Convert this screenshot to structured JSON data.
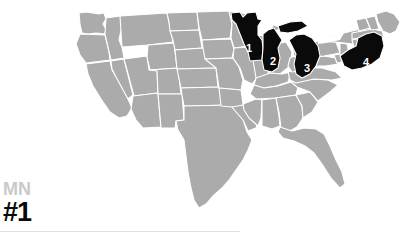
{
  "page": {
    "background_color": "#ffffff",
    "width": 415,
    "height": 237
  },
  "map": {
    "name": "united-states-map",
    "base_state_color": "#ababab",
    "border_color": "#ffffff",
    "highlight_color": "#0a0a0a",
    "label_color": "#ffffff",
    "water_color": "#ffffff",
    "highlighted_states": [
      {
        "rank": "1",
        "code": "MN",
        "name": "Minnesota",
        "x": 249,
        "y": 48
      },
      {
        "rank": "2",
        "code": "WI",
        "name": "Wisconsin",
        "x": 273,
        "y": 61
      },
      {
        "rank": "3",
        "code": "MI",
        "name": "Michigan",
        "x": 307,
        "y": 68
      },
      {
        "rank": "4",
        "code": "NY",
        "name": "New York",
        "x": 366,
        "y": 62
      }
    ]
  },
  "legend": {
    "state_abbr": "MN",
    "rank": "#1",
    "state_abbr_color": "#c9c9c9",
    "rank_color": "#0a0a0a"
  },
  "rule": {
    "color": "#e2e2e2"
  }
}
